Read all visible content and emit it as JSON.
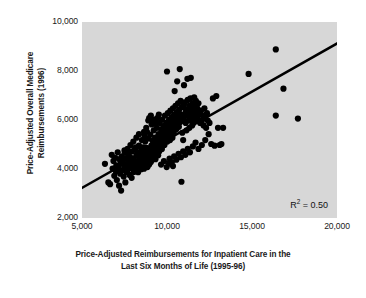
{
  "chart_data": {
    "type": "scatter",
    "title": "",
    "xlabel": "Price-Adjusted Reimbursements for Inpatient Care in the Last Six Months of Life (1995-96)",
    "xlabel_line1": "Price-Adjusted Reimbursements for Inpatient Care in the",
    "xlabel_line2": "Last Six Months of Life (1995-96)",
    "ylabel": "Price-Adjusted Overall Medicare Reimbursements (1996)",
    "ylabel_line1": "Price-Adjusted Overall Medicare",
    "ylabel_line2": "Reimbursements (1996)",
    "xlim": [
      5000,
      20000
    ],
    "ylim": [
      2000,
      10000
    ],
    "xticks": [
      5000,
      10000,
      15000,
      20000
    ],
    "xtick_labels": [
      "5,000",
      "10,000",
      "15,000",
      "20,000"
    ],
    "yticks": [
      2000,
      4000,
      6000,
      8000,
      10000
    ],
    "ytick_labels": [
      "2,000",
      "4,000",
      "6,000",
      "8,000",
      "10,000"
    ],
    "grid": false,
    "legend": "none",
    "plot_background_color": "#d7d7d7",
    "marker_color": "#000000",
    "marker_size": 5,
    "annotation_r2_label": "R",
    "annotation_r2_exponent": "2",
    "annotation_r2_value": "= 0.50",
    "annotation_r2_text": "R2 = 0.50",
    "trendline": {
      "label": "least-squares fit",
      "color": "#000000",
      "width": 2.6,
      "x_start": 5000,
      "y_start": 3230,
      "x_end": 20000,
      "y_end": 9120
    },
    "points": [
      [
        6350,
        4210
      ],
      [
        6550,
        3450
      ],
      [
        6650,
        3380
      ],
      [
        6750,
        4580
      ],
      [
        6800,
        4020
      ],
      [
        6850,
        4330
      ],
      [
        6900,
        3720
      ],
      [
        6950,
        4460
      ],
      [
        7000,
        3900
      ],
      [
        7020,
        4150
      ],
      [
        7050,
        3550
      ],
      [
        7100,
        4680
      ],
      [
        7150,
        4020
      ],
      [
        7180,
        3320
      ],
      [
        7200,
        4400
      ],
      [
        7250,
        3810
      ],
      [
        7280,
        4230
      ],
      [
        7300,
        3120
      ],
      [
        7350,
        4520
      ],
      [
        7380,
        3960
      ],
      [
        7400,
        4340
      ],
      [
        7450,
        3690
      ],
      [
        7500,
        4760
      ],
      [
        7520,
        4080
      ],
      [
        7550,
        3450
      ],
      [
        7600,
        4420
      ],
      [
        7620,
        3880
      ],
      [
        7650,
        4200
      ],
      [
        7700,
        4600
      ],
      [
        7720,
        3990
      ],
      [
        7750,
        4350
      ],
      [
        7800,
        3760
      ],
      [
        7820,
        4500
      ],
      [
        7850,
        4100
      ],
      [
        7900,
        4280
      ],
      [
        7920,
        3640
      ],
      [
        7950,
        4720
      ],
      [
        8000,
        4010
      ],
      [
        8020,
        4420
      ],
      [
        8050,
        3880
      ],
      [
        8100,
        4330
      ],
      [
        8120,
        4850
      ],
      [
        8150,
        4180
      ],
      [
        8180,
        3950
      ],
      [
        8200,
        4560
      ],
      [
        8250,
        4100
      ],
      [
        8280,
        4680
      ],
      [
        8300,
        3870
      ],
      [
        8320,
        4300
      ],
      [
        8350,
        4950
      ],
      [
        8380,
        4450
      ],
      [
        8400,
        4090
      ],
      [
        8420,
        4620
      ],
      [
        8450,
        4240
      ],
      [
        8480,
        3990
      ],
      [
        8500,
        4790
      ],
      [
        8520,
        4380
      ],
      [
        8550,
        4150
      ],
      [
        8580,
        4560
      ],
      [
        8600,
        4880
      ],
      [
        8620,
        4290
      ],
      [
        8650,
        4010
      ],
      [
        8680,
        4650
      ],
      [
        8700,
        4420
      ],
      [
        8720,
        5120
      ],
      [
        8750,
        4200
      ],
      [
        8780,
        4540
      ],
      [
        8800,
        4860
      ],
      [
        8820,
        4320
      ],
      [
        8850,
        4080
      ],
      [
        8880,
        4700
      ],
      [
        8900,
        5250
      ],
      [
        8920,
        4450
      ],
      [
        8950,
        4180
      ],
      [
        8980,
        4820
      ],
      [
        9000,
        4560
      ],
      [
        9020,
        5400
      ],
      [
        9050,
        4290
      ],
      [
        9080,
        4950
      ],
      [
        9100,
        4640
      ],
      [
        9120,
        4380
      ],
      [
        9150,
        5150
      ],
      [
        9180,
        4780
      ],
      [
        9200,
        4480
      ],
      [
        9220,
        5580
      ],
      [
        9250,
        4920
      ],
      [
        9280,
        4650
      ],
      [
        9300,
        5280
      ],
      [
        9320,
        4400
      ],
      [
        9350,
        5020
      ],
      [
        9380,
        4760
      ],
      [
        9400,
        5680
      ],
      [
        9420,
        5180
      ],
      [
        9450,
        4880
      ],
      [
        9480,
        4560
      ],
      [
        9500,
        5420
      ],
      [
        9520,
        5050
      ],
      [
        9550,
        4720
      ],
      [
        9580,
        5880
      ],
      [
        9600,
        5280
      ],
      [
        9620,
        4950
      ],
      [
        9650,
        5620
      ],
      [
        9680,
        5150
      ],
      [
        9700,
        4820
      ],
      [
        9720,
        6020
      ],
      [
        9750,
        5480
      ],
      [
        9780,
        5080
      ],
      [
        9800,
        5750
      ],
      [
        9820,
        5320
      ],
      [
        9850,
        4980
      ],
      [
        9880,
        6180
      ],
      [
        9900,
        5580
      ],
      [
        9920,
        5220
      ],
      [
        9950,
        5880
      ],
      [
        9980,
        5450
      ],
      [
        10000,
        7980
      ],
      [
        10020,
        5120
      ],
      [
        10050,
        6280
      ],
      [
        10080,
        5680
      ],
      [
        10100,
        5350
      ],
      [
        10120,
        6020
      ],
      [
        10150,
        5520
      ],
      [
        10180,
        5180
      ],
      [
        10200,
        6380
      ],
      [
        10220,
        5820
      ],
      [
        10250,
        5420
      ],
      [
        10280,
        6120
      ],
      [
        10300,
        5620
      ],
      [
        10320,
        5280
      ],
      [
        10350,
        6480
      ],
      [
        10380,
        5920
      ],
      [
        10400,
        5520
      ],
      [
        10420,
        6220
      ],
      [
        10450,
        7180
      ],
      [
        10480,
        5720
      ],
      [
        10500,
        6580
      ],
      [
        10520,
        6020
      ],
      [
        10550,
        5620
      ],
      [
        10580,
        6320
      ],
      [
        10600,
        7580
      ],
      [
        10620,
        5820
      ],
      [
        10650,
        6680
      ],
      [
        10680,
        6120
      ],
      [
        10700,
        5720
      ],
      [
        10720,
        6420
      ],
      [
        10750,
        8080
      ],
      [
        10780,
        5920
      ],
      [
        10800,
        6780
      ],
      [
        10820,
        6220
      ],
      [
        10850,
        3480
      ],
      [
        10880,
        6520
      ],
      [
        10900,
        5480
      ],
      [
        10920,
        6080
      ],
      [
        10950,
        5180
      ],
      [
        10980,
        6620
      ],
      [
        11000,
        7420
      ],
      [
        11020,
        5980
      ],
      [
        11050,
        6720
      ],
      [
        11080,
        6280
      ],
      [
        11100,
        5880
      ],
      [
        11120,
        6420
      ],
      [
        11150,
        5580
      ],
      [
        11180,
        6180
      ],
      [
        11200,
        7680
      ],
      [
        11220,
        6820
      ],
      [
        11250,
        6380
      ],
      [
        11280,
        5980
      ],
      [
        11300,
        6580
      ],
      [
        11320,
        5680
      ],
      [
        11350,
        6280
      ],
      [
        11380,
        6880
      ],
      [
        11400,
        7720
      ],
      [
        11420,
        6480
      ],
      [
        11450,
        6080
      ],
      [
        11480,
        5780
      ],
      [
        11500,
        6680
      ],
      [
        11520,
        6280
      ],
      [
        11550,
        5880
      ],
      [
        11580,
        6420
      ],
      [
        11600,
        6920
      ],
      [
        11620,
        5980
      ],
      [
        11650,
        6580
      ],
      [
        11680,
        6180
      ],
      [
        11700,
        6780
      ],
      [
        11720,
        6380
      ],
      [
        11750,
        5980
      ],
      [
        11780,
        6480
      ],
      [
        11800,
        6080
      ],
      [
        11850,
        6680
      ],
      [
        11900,
        6280
      ],
      [
        11950,
        5880
      ],
      [
        12000,
        6380
      ],
      [
        12050,
        5980
      ],
      [
        12100,
        6180
      ],
      [
        12150,
        5780
      ],
      [
        12200,
        6480
      ],
      [
        12250,
        6080
      ],
      [
        12300,
        5680
      ],
      [
        12350,
        6280
      ],
      [
        12400,
        5980
      ],
      [
        12450,
        5420
      ],
      [
        12500,
        5880
      ],
      [
        12600,
        5020
      ],
      [
        12700,
        6880
      ],
      [
        12800,
        4950
      ],
      [
        12900,
        6980
      ],
      [
        13000,
        5680
      ],
      [
        13100,
        4980
      ],
      [
        13200,
        5020
      ],
      [
        13300,
        5680
      ],
      [
        14800,
        7880
      ],
      [
        16400,
        8880
      ],
      [
        16400,
        6180
      ],
      [
        16850,
        7280
      ],
      [
        17700,
        6060
      ],
      [
        9050,
        6180
      ],
      [
        9180,
        6020
      ],
      [
        9320,
        5880
      ],
      [
        9420,
        6080
      ],
      [
        9520,
        6220
      ],
      [
        8900,
        5980
      ],
      [
        9100,
        5820
      ],
      [
        8780,
        5680
      ],
      [
        8650,
        5520
      ],
      [
        8950,
        6080
      ],
      [
        10150,
        4420
      ],
      [
        10280,
        4280
      ],
      [
        10420,
        4520
      ],
      [
        10550,
        4380
      ],
      [
        10680,
        4620
      ],
      [
        10820,
        4480
      ],
      [
        10950,
        4720
      ],
      [
        11080,
        4580
      ],
      [
        11220,
        4820
      ],
      [
        11350,
        4680
      ],
      [
        9650,
        4180
      ],
      [
        9820,
        4320
      ],
      [
        9980,
        4080
      ],
      [
        10120,
        4220
      ],
      [
        10350,
        4120
      ],
      [
        8200,
        5280
      ],
      [
        8350,
        5420
      ],
      [
        8520,
        5180
      ],
      [
        8680,
        5350
      ],
      [
        8820,
        5520
      ],
      [
        11520,
        4920
      ],
      [
        11680,
        5080
      ],
      [
        11850,
        4820
      ],
      [
        12050,
        4980
      ],
      [
        12250,
        5180
      ],
      [
        7850,
        4980
      ],
      [
        8020,
        5120
      ],
      [
        8180,
        4880
      ],
      [
        7680,
        4820
      ],
      [
        7520,
        4680
      ]
    ]
  }
}
